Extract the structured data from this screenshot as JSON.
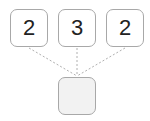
{
  "diagram": {
    "top_boxes": [
      {
        "value": "2"
      },
      {
        "value": "3"
      },
      {
        "value": "2"
      }
    ],
    "bottom_box": {
      "value": ""
    },
    "colors": {
      "border": "#a8a8a8",
      "connector": "#b0b0b0",
      "empty_fill": "#f2f2f2",
      "text": "#222222"
    }
  }
}
